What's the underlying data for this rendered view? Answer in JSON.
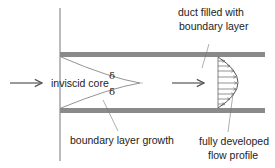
{
  "diagram": {
    "type": "duct-flow-boundary-layer",
    "labels": {
      "inviscid_core": "inviscid core",
      "delta_top": "δ",
      "delta_bottom": "δ",
      "boundary_layer_growth": "boundary layer growth",
      "duct_filled_line1": "duct filled with",
      "duct_filled_line2": "boundary layer",
      "fully_developed_line1": "fully developed",
      "fully_developed_line2": "flow profile"
    },
    "colors": {
      "wall": "#8a8a8a",
      "line": "#555555",
      "text": "#222222"
    }
  }
}
